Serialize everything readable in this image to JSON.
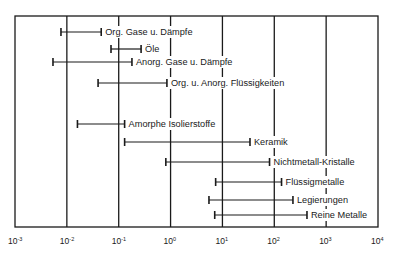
{
  "chart_data": {
    "type": "range-bar",
    "title": "",
    "xlabel": "",
    "ylabel": "",
    "x_scale": "log",
    "xlim": [
      0.001,
      10000
    ],
    "grid": "vertical at each decade",
    "legend": "none (labels placed at right end of each bar)",
    "ticks": [
      {
        "exp": "-3",
        "value": 0.001
      },
      {
        "exp": "-2",
        "value": 0.01
      },
      {
        "exp": "-1",
        "value": 0.1
      },
      {
        "exp": "0",
        "value": 1
      },
      {
        "exp": "1",
        "value": 10
      },
      {
        "exp": "2",
        "value": 100
      },
      {
        "exp": "3",
        "value": 1000
      },
      {
        "exp": "4",
        "value": 10000
      }
    ],
    "series": [
      {
        "name": "Org. Gase u. Dämpfe",
        "min": 0.0077,
        "max": 0.046
      },
      {
        "name": "Öle",
        "min": 0.071,
        "max": 0.27
      },
      {
        "name": "Anorg. Gase u. Dämpfe",
        "min": 0.0054,
        "max": 0.18
      },
      {
        "name": "Org. u. Anorg. Flüssigkeiten",
        "min": 0.04,
        "max": 0.85
      },
      {
        "name": "Amorphe Isolierstoffe",
        "min": 0.016,
        "max": 0.13
      },
      {
        "name": "Keramik",
        "min": 0.13,
        "max": 34
      },
      {
        "name": "Nichtmetall-Kristalle",
        "min": 0.81,
        "max": 81
      },
      {
        "name": "Flüssigmetalle",
        "min": 7.4,
        "max": 138
      },
      {
        "name": "Legierungen",
        "min": 5.5,
        "max": 229
      },
      {
        "name": "Reine Metalle",
        "min": 7.1,
        "max": 427
      }
    ]
  },
  "layout": {
    "plot_left": 15,
    "plot_right": 378,
    "plot_top": 16,
    "plot_bottom": 227,
    "bar_y": [
      32,
      49,
      62,
      83,
      124,
      142,
      162,
      182,
      200,
      215
    ],
    "colors": {
      "line": "#1a1a1a",
      "background": "#ffffff"
    }
  }
}
